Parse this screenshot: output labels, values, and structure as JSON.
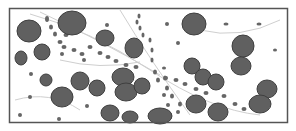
{
  "figure": {
    "width": 296,
    "height": 131,
    "background": "#ffffff",
    "frame": {
      "x": 9.5,
      "y": 8.5,
      "w": 278,
      "h": 114,
      "stroke": "#555555"
    },
    "colors": {
      "cell_fill": "#606060",
      "cell_stroke": "#3f3f3f",
      "dot_fill": "#666666",
      "strand": "#cfcfcf"
    },
    "large_cells": [
      {
        "cx": 29,
        "cy": 31,
        "rx": 12,
        "ry": 11
      },
      {
        "cx": 72,
        "cy": 23,
        "rx": 14,
        "ry": 12
      },
      {
        "cx": 42,
        "cy": 52,
        "rx": 8,
        "ry": 8
      },
      {
        "cx": 21,
        "cy": 58,
        "rx": 6,
        "ry": 7
      },
      {
        "cx": 105,
        "cy": 38,
        "rx": 9,
        "ry": 8
      },
      {
        "cx": 134,
        "cy": 48,
        "rx": 9,
        "ry": 10
      },
      {
        "cx": 80,
        "cy": 81,
        "rx": 9,
        "ry": 9
      },
      {
        "cx": 46,
        "cy": 80,
        "rx": 6,
        "ry": 6
      },
      {
        "cx": 62,
        "cy": 97,
        "rx": 11,
        "ry": 10
      },
      {
        "cx": 97,
        "cy": 88,
        "rx": 8,
        "ry": 8
      },
      {
        "cx": 123,
        "cy": 77,
        "rx": 11,
        "ry": 9
      },
      {
        "cx": 126,
        "cy": 92,
        "rx": 11,
        "ry": 9
      },
      {
        "cx": 142,
        "cy": 86,
        "rx": 8,
        "ry": 8
      },
      {
        "cx": 110,
        "cy": 113,
        "rx": 9,
        "ry": 8
      },
      {
        "cx": 130,
        "cy": 117,
        "rx": 8,
        "ry": 6
      },
      {
        "cx": 160,
        "cy": 116,
        "rx": 12,
        "ry": 8
      },
      {
        "cx": 194,
        "cy": 24,
        "rx": 12,
        "ry": 11
      },
      {
        "cx": 243,
        "cy": 46,
        "rx": 11,
        "ry": 11
      },
      {
        "cx": 241,
        "cy": 66,
        "rx": 10,
        "ry": 9
      },
      {
        "cx": 192,
        "cy": 66,
        "rx": 8,
        "ry": 8
      },
      {
        "cx": 203,
        "cy": 77,
        "rx": 8,
        "ry": 8
      },
      {
        "cx": 216,
        "cy": 82,
        "rx": 8,
        "ry": 8
      },
      {
        "cx": 196,
        "cy": 104,
        "rx": 10,
        "ry": 9
      },
      {
        "cx": 218,
        "cy": 112,
        "rx": 10,
        "ry": 9
      },
      {
        "cx": 267,
        "cy": 89,
        "rx": 10,
        "ry": 9
      },
      {
        "cx": 260,
        "cy": 104,
        "rx": 11,
        "ry": 9
      }
    ],
    "small_dots": [
      {
        "cx": 47,
        "cy": 19,
        "rx": 2,
        "ry": 3
      },
      {
        "cx": 51,
        "cy": 27,
        "rx": 2,
        "ry": 2.5
      },
      {
        "cx": 55,
        "cy": 34,
        "rx": 2,
        "ry": 2.5
      },
      {
        "cx": 60,
        "cy": 42,
        "rx": 2.5,
        "ry": 2
      },
      {
        "cx": 66,
        "cy": 35,
        "rx": 2.5,
        "ry": 2
      },
      {
        "cx": 64,
        "cy": 47,
        "rx": 2.5,
        "ry": 2
      },
      {
        "cx": 74,
        "cy": 50,
        "rx": 2.5,
        "ry": 2
      },
      {
        "cx": 82,
        "cy": 54,
        "rx": 2.5,
        "ry": 2
      },
      {
        "cx": 90,
        "cy": 47,
        "rx": 2.5,
        "ry": 2
      },
      {
        "cx": 100,
        "cy": 53,
        "rx": 2.5,
        "ry": 2
      },
      {
        "cx": 108,
        "cy": 57,
        "rx": 2.5,
        "ry": 2
      },
      {
        "cx": 116,
        "cy": 61,
        "rx": 2.5,
        "ry": 2
      },
      {
        "cx": 126,
        "cy": 65,
        "rx": 2.5,
        "ry": 2
      },
      {
        "cx": 136,
        "cy": 67,
        "rx": 2.5,
        "ry": 2
      },
      {
        "cx": 139,
        "cy": 16,
        "rx": 1.5,
        "ry": 2.5
      },
      {
        "cx": 137,
        "cy": 22,
        "rx": 1.5,
        "ry": 2.5
      },
      {
        "cx": 140,
        "cy": 28,
        "rx": 1.5,
        "ry": 2.5
      },
      {
        "cx": 143,
        "cy": 35,
        "rx": 1.5,
        "ry": 2.5
      },
      {
        "cx": 150,
        "cy": 40,
        "rx": 1.5,
        "ry": 2.5
      },
      {
        "cx": 152,
        "cy": 50,
        "rx": 1.5,
        "ry": 2.5
      },
      {
        "cx": 152,
        "cy": 60,
        "rx": 1.5,
        "ry": 2.5
      },
      {
        "cx": 155,
        "cy": 72,
        "rx": 2,
        "ry": 2.5
      },
      {
        "cx": 158,
        "cy": 80,
        "rx": 2,
        "ry": 2.5
      },
      {
        "cx": 165,
        "cy": 78,
        "rx": 2,
        "ry": 2.5
      },
      {
        "cx": 167,
        "cy": 88,
        "rx": 2,
        "ry": 2.5
      },
      {
        "cx": 172,
        "cy": 96,
        "rx": 2,
        "ry": 2.5
      },
      {
        "cx": 180,
        "cy": 104,
        "rx": 2,
        "ry": 2.5
      },
      {
        "cx": 168,
        "cy": 105,
        "rx": 2,
        "ry": 2
      },
      {
        "cx": 164,
        "cy": 95,
        "rx": 2,
        "ry": 2
      },
      {
        "cx": 166,
        "cy": 78,
        "rx": 2,
        "ry": 2
      },
      {
        "cx": 176,
        "cy": 80,
        "rx": 2.5,
        "ry": 2
      },
      {
        "cx": 185,
        "cy": 84,
        "rx": 2.5,
        "ry": 2
      },
      {
        "cx": 196,
        "cy": 89,
        "rx": 2.5,
        "ry": 2
      },
      {
        "cx": 206,
        "cy": 93,
        "rx": 2.5,
        "ry": 2
      },
      {
        "cx": 224,
        "cy": 96,
        "rx": 2.5,
        "ry": 2
      },
      {
        "cx": 235,
        "cy": 104,
        "rx": 2.5,
        "ry": 2
      },
      {
        "cx": 244,
        "cy": 109,
        "rx": 2.5,
        "ry": 2
      },
      {
        "cx": 167,
        "cy": 24,
        "rx": 2,
        "ry": 2
      },
      {
        "cx": 178,
        "cy": 43,
        "rx": 2,
        "ry": 2
      },
      {
        "cx": 226,
        "cy": 24,
        "rx": 2.5,
        "ry": 1.5
      },
      {
        "cx": 259,
        "cy": 24,
        "rx": 2.5,
        "ry": 1.5
      },
      {
        "cx": 275,
        "cy": 50,
        "rx": 2,
        "ry": 1.5
      },
      {
        "cx": 107,
        "cy": 25,
        "rx": 2,
        "ry": 2
      },
      {
        "cx": 62,
        "cy": 54,
        "rx": 2,
        "ry": 2
      },
      {
        "cx": 84,
        "cy": 60,
        "rx": 2,
        "ry": 2
      },
      {
        "cx": 31,
        "cy": 74,
        "rx": 2,
        "ry": 2
      },
      {
        "cx": 30,
        "cy": 97,
        "rx": 2,
        "ry": 2
      },
      {
        "cx": 20,
        "cy": 115,
        "rx": 2,
        "ry": 2
      },
      {
        "cx": 87,
        "cy": 106,
        "rx": 2,
        "ry": 2
      },
      {
        "cx": 59,
        "cy": 119,
        "rx": 2,
        "ry": 2
      },
      {
        "cx": 164,
        "cy": 68,
        "rx": 2,
        "ry": 1.5
      },
      {
        "cx": 178,
        "cy": 112,
        "rx": 2,
        "ry": 2
      }
    ],
    "strands": [
      "M30 14 Q90 30 150 70 T260 115",
      "M40 12 Q100 40 160 75",
      "M120 10 Q150 60 190 115",
      "M60 60 Q100 70 140 62",
      "M200 30 Q240 40 280 20",
      "M15 100 Q50 90 80 110"
    ]
  }
}
